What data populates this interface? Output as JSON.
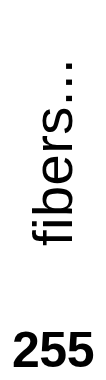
{
  "chart_data": {
    "type": "bar",
    "title": "",
    "subtitle": "",
    "xlabel": "",
    "ylabel": "fibers...",
    "categories": [],
    "values": [],
    "tick_labels": [
      "255"
    ],
    "annotations": [],
    "legend": [],
    "legend_position": "none",
    "grid": false,
    "note": "Cropped detail showing only the rotated y-axis title and a single axis tick value."
  },
  "canvas": {
    "width": 106,
    "height": 380,
    "background_color": "#ffffff",
    "foreground_color": "#000000"
  },
  "axis": {
    "label": "fibers...",
    "label_rotation_degrees": -90,
    "label_color": "#000000",
    "tick_value": "255",
    "tick_value_color": "#000000"
  }
}
